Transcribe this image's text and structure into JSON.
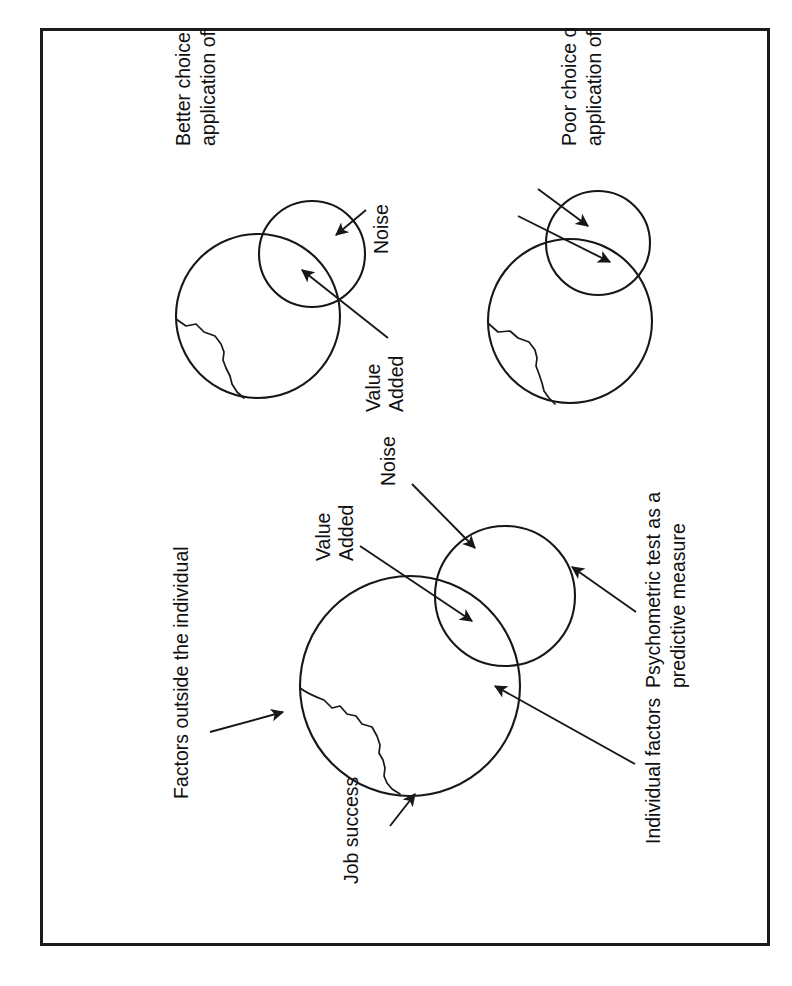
{
  "figure": {
    "type": "venn-diagram-set",
    "orientation": "rotated-90-ccw",
    "background_color": "#ffffff",
    "line_color": "#171717",
    "frame_color": "#1b1b1b",
    "labels": {
      "job_success": "Job success",
      "factors_outside": "Factors outside the individual",
      "individual_factors": "Individual factors",
      "psychometric_line1": "Psychometric test as a",
      "psychometric_line2": "predictive measure",
      "value_line1": "Value",
      "value_line2": "Added",
      "noise": "Noise"
    },
    "panels": [
      {
        "id": "main",
        "labels": [
          "Job success",
          "Factors outside the individual",
          "Individual factors",
          "Psychometric test as a predictive measure",
          "Value Added",
          "Noise"
        ]
      },
      {
        "id": "better",
        "caption_line1": "Better choice of test or better",
        "caption_line2": "application of same test",
        "labels": [
          "Value Added",
          "Noise"
        ]
      },
      {
        "id": "poor",
        "caption_line1": "Poor choice of test or poor",
        "caption_line2": "application of appropriate test",
        "labels": []
      }
    ]
  }
}
